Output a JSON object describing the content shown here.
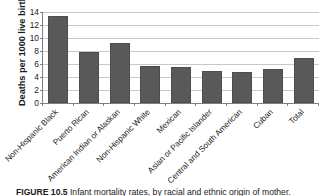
{
  "chart_data": {
    "type": "bar",
    "title": "",
    "xlabel": "",
    "ylabel": "Deaths per 1000 live births",
    "ylim": [
      0,
      14
    ],
    "ytick_step": 2,
    "yticks": [
      14,
      12,
      10,
      8,
      6,
      4,
      2,
      0
    ],
    "grid": true,
    "legend": "none",
    "bar_color": "#595959",
    "gridline_color": "#c8c8c8",
    "axis_color": "#808080",
    "categories": [
      "Non-Hispanic Black",
      "Puerto Rican",
      "American Indian or Alaskan",
      "Non-Hispanic White",
      "Mexican",
      "Asian or Pacific Islander",
      "Central and South American",
      "Cuban",
      "Total"
    ],
    "values": [
      13.4,
      7.8,
      9.3,
      5.7,
      5.5,
      5.0,
      4.7,
      5.3,
      6.9
    ]
  },
  "caption": {
    "label": "FIGURE 10.5",
    "text": "Infant mortality rates, by racial and ethnic origin of mother."
  }
}
